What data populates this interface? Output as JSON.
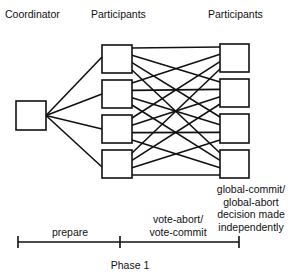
{
  "headers": {
    "coordinator": "Coordinator",
    "participants_left": "Participants",
    "participants_right": "Participants"
  },
  "nodes": {
    "coordinator": {
      "x": 16,
      "y": 101,
      "w": 30,
      "h": 29
    },
    "participants_left": [
      {
        "x": 102,
        "y": 45,
        "w": 30,
        "h": 28
      },
      {
        "x": 102,
        "y": 80,
        "w": 30,
        "h": 28
      },
      {
        "x": 102,
        "y": 115,
        "w": 30,
        "h": 28
      },
      {
        "x": 102,
        "y": 150,
        "w": 30,
        "h": 28
      }
    ],
    "participants_right": [
      {
        "x": 220,
        "y": 44,
        "w": 29,
        "h": 28
      },
      {
        "x": 220,
        "y": 79,
        "w": 29,
        "h": 28
      },
      {
        "x": 220,
        "y": 114,
        "w": 29,
        "h": 29
      },
      {
        "x": 220,
        "y": 150,
        "w": 29,
        "h": 28
      }
    ]
  },
  "labels": {
    "decision_line1": "global-commit/",
    "decision_line2": "global-abort",
    "decision_line3": "decision made",
    "decision_line4": "independently",
    "vote_line1": "vote-abort/",
    "vote_line2": "vote-commit",
    "prepare": "prepare",
    "phase": "Phase 1"
  },
  "timeline": {
    "y": 242,
    "x_start": 18,
    "x_mid": 120,
    "x_end": 239
  }
}
